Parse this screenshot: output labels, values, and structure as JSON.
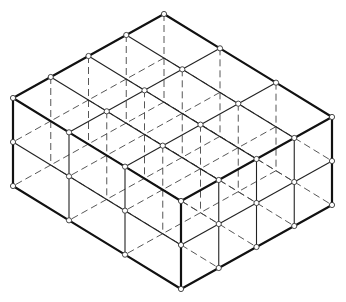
{
  "geometry": {
    "origin": [
      164,
      14
    ],
    "dir_a": [
      -37.75,
      21
    ],
    "dir_b": [
      56,
      34.33
    ],
    "dir_up": [
      0,
      44
    ],
    "count_a": 4,
    "count_b": 3,
    "count_layers": 2
  },
  "style": {
    "line_color": "#111111",
    "node_fill": "#ffffff",
    "node_radius": 2.6
  }
}
